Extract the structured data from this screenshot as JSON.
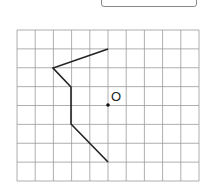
{
  "answer_box": {
    "value": ""
  },
  "diagram": {
    "grid": {
      "cols": 10,
      "rows": 8,
      "x0": 17,
      "y0": 30,
      "x1": 199,
      "y1": 181,
      "line_color": "#9a9a9a"
    },
    "polyline": {
      "color": "#222222",
      "points": [
        [
          108,
          49
        ],
        [
          53,
          68
        ],
        [
          71,
          87
        ],
        [
          71,
          124
        ],
        [
          108,
          162
        ]
      ]
    },
    "center_point": {
      "label": "O",
      "x": 108,
      "y": 105
    }
  }
}
